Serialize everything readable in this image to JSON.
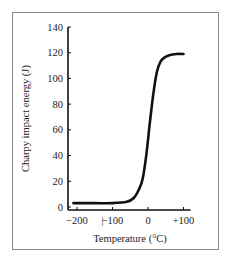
{
  "chart_data": {
    "type": "line",
    "title": "",
    "xlabel": "Temperature (°C)",
    "ylabel": "Charpy impact energy (J)",
    "x_ticks": [
      "-200",
      "-100",
      "0",
      "+100"
    ],
    "y_ticks": [
      "0",
      "20",
      "40",
      "60",
      "80",
      "100",
      "120",
      "140"
    ],
    "xlim": [
      -220,
      120
    ],
    "ylim": [
      0,
      140
    ],
    "grid": false,
    "legend": null,
    "series": [
      {
        "name": "Charpy impact energy",
        "x": [
          -210,
          -150,
          -100,
          -60,
          -40,
          -25,
          -15,
          -5,
          5,
          15,
          25,
          35,
          45,
          60,
          80,
          100
        ],
        "y": [
          3,
          3,
          3,
          4,
          7,
          14,
          22,
          40,
          65,
          88,
          105,
          113,
          116,
          118,
          119,
          119
        ]
      }
    ]
  },
  "axes": {
    "xlabel": "Temperature (°C)",
    "ylabel": "Charpy impact energy (J)"
  }
}
